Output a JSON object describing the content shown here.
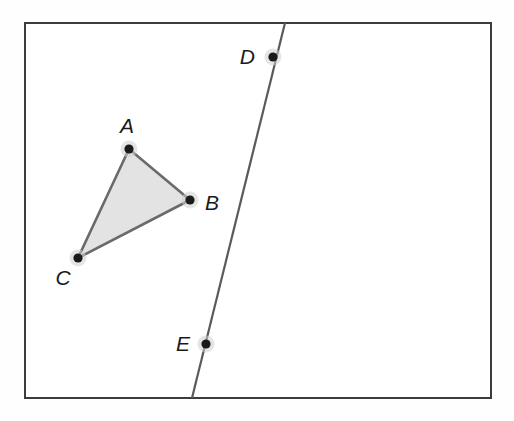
{
  "figure": {
    "background_color": "#fefefe",
    "frame": {
      "name": "bounding-box",
      "x": 25,
      "y": 23,
      "width": 466,
      "height": 375,
      "stroke_color": "#3c3c3c",
      "stroke_width": 2,
      "fill": "#ffffff"
    }
  },
  "style": {
    "point_fill": "#1a1a1a",
    "point_halo": "#cfcfcf",
    "point_radius": 4.6,
    "halo_radius": 8.5,
    "triangle_fill": "#e3e3e3",
    "triangle_stroke": "#6a6a6a",
    "triangle_stroke_width": 2.6,
    "line_stroke": "#5a5a5a",
    "line_stroke_width": 2.2,
    "label_color": "#1a1a1a"
  },
  "points": [
    {
      "id": "A",
      "label": "A",
      "x": 129,
      "y": 149,
      "label_x": 127,
      "label_y": 133,
      "label_anchor": "middle"
    },
    {
      "id": "B",
      "label": "B",
      "x": 190,
      "y": 200,
      "label_x": 205,
      "label_y": 210,
      "label_anchor": "start"
    },
    {
      "id": "C",
      "label": "C",
      "x": 78,
      "y": 258,
      "label_x": 63,
      "label_y": 285,
      "label_anchor": "middle"
    },
    {
      "id": "D",
      "label": "D",
      "x": 273,
      "y": 57,
      "label_x": 255,
      "label_y": 64,
      "label_anchor": "end"
    },
    {
      "id": "E",
      "label": "E",
      "x": 206,
      "y": 344,
      "label_x": 190,
      "label_y": 351,
      "label_anchor": "end"
    }
  ],
  "shapes": {
    "triangle": {
      "name": "triangle-abc",
      "vertices": [
        "A",
        "B",
        "C"
      ],
      "points_attr": "129,149 190,200 78,258"
    },
    "line": {
      "name": "line-de",
      "through": [
        "D",
        "E"
      ],
      "x1": 285,
      "y1": 23,
      "x2": 192,
      "y2": 398
    }
  }
}
